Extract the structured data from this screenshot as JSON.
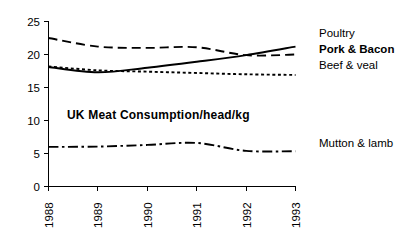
{
  "chart_data": {
    "type": "line",
    "title": "UK  Meat  Consumption/head/kg",
    "xlabel": "",
    "ylabel": "",
    "x": [
      "1988",
      "1989",
      "1990",
      "1991",
      "1992",
      "1993"
    ],
    "categories": [
      "1988",
      "1989",
      "1990",
      "1991",
      "1992",
      "1993"
    ],
    "xlim": [
      1988,
      1993
    ],
    "ylim": [
      0,
      25
    ],
    "y_ticks": [
      "0",
      "5",
      "10",
      "15",
      "20",
      "25"
    ],
    "x_ticks": [
      "1988",
      "1989",
      "1990",
      "1991",
      "1992",
      "1993"
    ],
    "grid": false,
    "legend_position": "right",
    "series": [
      {
        "name": "Poultry",
        "style": "dashed",
        "bold_label": false,
        "values": [
          22.5,
          21.2,
          21.0,
          21.1,
          19.9,
          20.0
        ]
      },
      {
        "name": "Pork & Bacon",
        "style": "solid",
        "bold_label": true,
        "values": [
          18.1,
          17.3,
          18.0,
          18.9,
          19.9,
          21.2
        ]
      },
      {
        "name": "Beef & veal",
        "style": "dotted",
        "bold_label": false,
        "values": [
          18.2,
          17.6,
          17.4,
          17.2,
          17.0,
          16.9
        ]
      },
      {
        "name": "Mutton & lamb",
        "style": "dashdot",
        "bold_label": false,
        "values": [
          6.0,
          6.05,
          6.3,
          6.6,
          5.4,
          5.35
        ]
      }
    ],
    "colors": {
      "line": "#000000",
      "axis": "#000000",
      "text": "#000000",
      "background": "#ffffff"
    }
  },
  "legend": {
    "items": [
      {
        "label": "Poultry"
      },
      {
        "label": "Pork & Bacon"
      },
      {
        "label": "Beef & veal"
      },
      {
        "label": "Mutton & lamb"
      }
    ]
  },
  "axes": {
    "y_labels": [
      "25",
      "20",
      "15",
      "10",
      "5",
      "0"
    ],
    "x_labels": [
      "1988",
      "1989",
      "1990",
      "1991",
      "1992",
      "1993"
    ]
  },
  "title": "UK  Meat  Consumption/head/kg"
}
